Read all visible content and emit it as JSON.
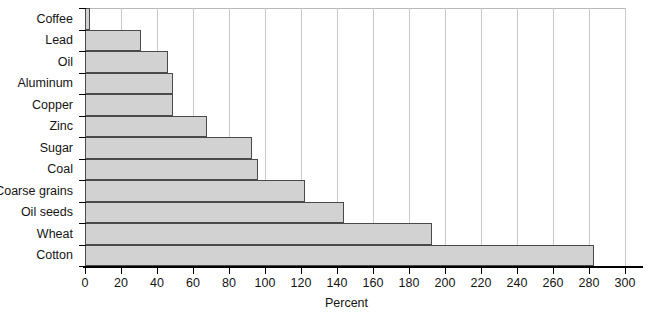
{
  "chart_data": {
    "type": "bar",
    "orientation": "horizontal",
    "title": "",
    "xlabel": "Percent",
    "ylabel": "",
    "xlim": [
      0,
      300
    ],
    "xticks": [
      0,
      20,
      40,
      60,
      80,
      100,
      120,
      140,
      160,
      180,
      200,
      220,
      240,
      260,
      280,
      300
    ],
    "grid": true,
    "legend": false,
    "categories": [
      "Coffee",
      "Lead",
      "Oil",
      "Aluminum",
      "Copper",
      "Zinc",
      "Sugar",
      "Coal",
      "Coarse grains",
      "Oil seeds",
      "Wheat",
      "Cotton"
    ],
    "values": [
      3,
      31,
      46,
      49,
      49,
      68,
      93,
      96,
      122,
      144,
      193,
      283
    ],
    "bar_fill_color": "#d2d2d2",
    "bar_edge_color": "#4a4a4a",
    "gridline_color": "#c9c9c9",
    "axis_color": "#000000"
  }
}
